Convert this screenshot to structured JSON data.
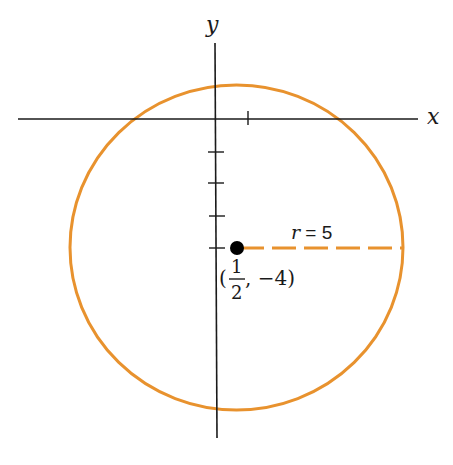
{
  "diagram": {
    "type": "circle-on-coordinate-plane",
    "axes": {
      "x_label": "x",
      "y_label": "y"
    },
    "circle": {
      "center_label_num": "1",
      "center_label_den": "2",
      "center_label_open": "(",
      "center_label_rest": ", −4)",
      "center": [
        0.5,
        -4
      ],
      "radius": 5,
      "radius_label": "r = 5",
      "radius_label_var": "r",
      "radius_label_eq": " = 5",
      "color": "#e8922e"
    },
    "colors": {
      "axis": "#1a1a1a",
      "circle": "#e8922e",
      "point": "#000000"
    }
  }
}
